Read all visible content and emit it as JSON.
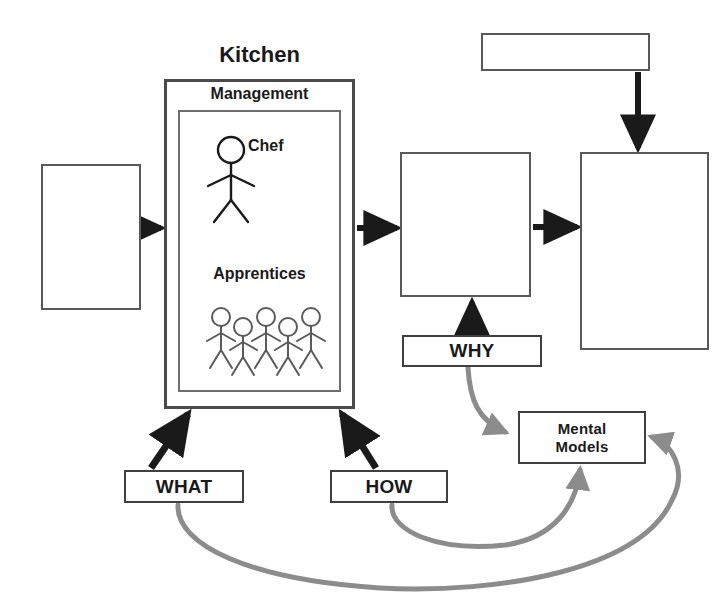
{
  "diagram": {
    "kitchen": {
      "title": "Kitchen",
      "management_label": "Management",
      "chef_label": "Chef",
      "apprentices_label": "Apprentices",
      "apprentice_count": 5
    },
    "labeled_boxes": {
      "why": "WHY",
      "what": "WHAT",
      "how": "HOW",
      "mental_models_line1": "Mental",
      "mental_models_line2": "Models"
    },
    "blank_boxes": [
      {
        "name": "box-left",
        "text": ""
      },
      {
        "name": "box-middle",
        "text": ""
      },
      {
        "name": "box-right",
        "text": ""
      },
      {
        "name": "box-top",
        "text": ""
      }
    ],
    "colors": {
      "black_arrow": "#1a1a1a",
      "gray_arrow": "#8c8c8c",
      "box_border": "#595959",
      "text": "#1a1a1a",
      "background": "#ffffff"
    },
    "connections": [
      {
        "from": "box-left",
        "to": "kitchen",
        "style": "black-straight-right"
      },
      {
        "from": "kitchen",
        "to": "box-middle",
        "style": "black-straight-right"
      },
      {
        "from": "box-middle",
        "to": "box-right",
        "style": "black-straight-right"
      },
      {
        "from": "box-top",
        "to": "box-right",
        "style": "black-straight-down"
      },
      {
        "from": "WHY",
        "to": "box-middle",
        "style": "black-straight-up"
      },
      {
        "from": "WHAT",
        "to": "kitchen",
        "style": "black-diagonal-up-right"
      },
      {
        "from": "HOW",
        "to": "kitchen",
        "style": "black-diagonal-up-left"
      },
      {
        "from": "WHY",
        "to": "Mental Models",
        "style": "gray-curve"
      },
      {
        "from": "HOW",
        "to": "Mental Models",
        "style": "gray-curve-bottom"
      },
      {
        "from": "WHAT",
        "to": "Mental Models",
        "style": "gray-curve-wide-right"
      }
    ]
  }
}
